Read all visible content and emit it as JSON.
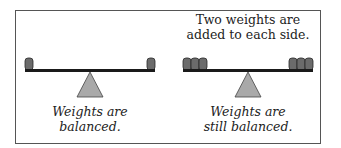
{
  "panels": [
    {
      "id": "before",
      "top_caption": [],
      "bottom_caption": [
        "Weights are",
        "balanced."
      ],
      "weights_per_side": 1
    },
    {
      "id": "after",
      "top_caption": [
        "Two weights are",
        "added to each side."
      ],
      "bottom_caption": [
        "Weights are",
        "still balanced."
      ],
      "weights_per_side": 3
    }
  ],
  "colors": {
    "beam": "#1a1a1a",
    "weight_fill": "#6b6b6b",
    "weight_stroke": "#2a2a2a",
    "fulcrum_fill": "#a9a9a9",
    "fulcrum_stroke": "#444444",
    "frame": "#555555"
  }
}
